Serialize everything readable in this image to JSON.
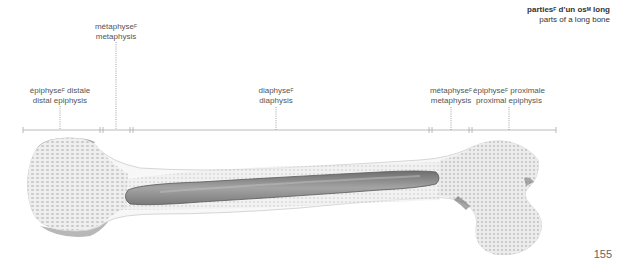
{
  "title": {
    "fr_text": "parties",
    "fr_gender": "F",
    "fr_text2": " d'un os",
    "fr_gender2": "M",
    "fr_text3": " long",
    "en": "parts of a long bone"
  },
  "labels": [
    {
      "id": "distal-epiphysis",
      "fr": "épiphyse",
      "gender": "F",
      "fr_suffix": " distale",
      "en": "distal epiphysis"
    },
    {
      "id": "distal-metaphysis",
      "fr": "métaphyse",
      "gender": "F",
      "fr_suffix": "",
      "en": "metaphysis"
    },
    {
      "id": "diaphysis",
      "fr": "diaphyse",
      "gender": "F",
      "fr_suffix": "",
      "en": "diaphysis"
    },
    {
      "id": "proximal-metaphysis",
      "fr": "métaphyse",
      "gender": "F",
      "fr_suffix": "",
      "en": "metaphysis"
    },
    {
      "id": "proximal-epiphysis",
      "fr": "épiphyse",
      "gender": "F",
      "fr_suffix": " proximale",
      "en": "proximal epiphysis"
    }
  ],
  "page_number": "155",
  "colors": {
    "bone_spongy": "#e6e6e6",
    "bone_outline": "#d0d0d0",
    "marrow_cavity": "#8c8c8c",
    "bracket_line": "#9a9a9a",
    "leader_line": "#8a8a8a"
  }
}
